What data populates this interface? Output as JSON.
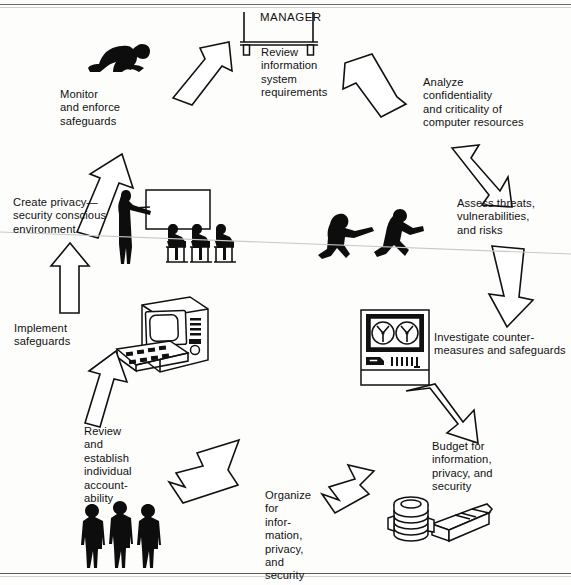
{
  "diagram": {
    "type": "circular-flow",
    "direction": "clockwise",
    "sign_label": "MANAGER",
    "stroke_color": "#111111",
    "fill_color": "#ffffff",
    "background_color": "#fdfdfc"
  },
  "steps": [
    {
      "id": "review",
      "label": "Review\ninformation\nsystem\nrequirements",
      "icon": "manager-desk-sign-icon",
      "position": "top"
    },
    {
      "id": "analyze",
      "label": "Analyze\nconfidentiality\nand criticality of\ncomputer resources",
      "icon": "none",
      "position": "upper-right"
    },
    {
      "id": "assess",
      "label": "Assess threats,\nvulnerabilities,\nand risks",
      "icon": "running-intruders-icon",
      "position": "right"
    },
    {
      "id": "investigate",
      "label": "Investigate counter-\nmeasures and safeguards",
      "icon": "tape-drive-icon",
      "position": "lower-right"
    },
    {
      "id": "budget",
      "label": "Budget for\ninformation,\nprivacy, and\nsecurity",
      "icon": "money-stack-icon",
      "position": "bottom-right"
    },
    {
      "id": "organize",
      "label": "Organize\nfor\ninfor-\nmation,\nprivacy,\nand\nsecurity",
      "icon": "none",
      "position": "bottom"
    },
    {
      "id": "accountability",
      "label": "Review\nand\nestablish\nindividual\naccount-\nability",
      "icon": "three-people-icon",
      "position": "bottom-left"
    },
    {
      "id": "implement",
      "label": "Implement\nsafeguards",
      "icon": "computer-terminal-icon",
      "position": "left"
    },
    {
      "id": "awareness",
      "label": "Create privacy—\nsecurity conscious\nenvironment",
      "icon": "classroom-presentation-icon",
      "position": "upper-left"
    },
    {
      "id": "monitor",
      "label": "Monitor\nand enforce\nsafeguards",
      "icon": "crawling-figure-icon",
      "position": "top-left"
    }
  ],
  "arrows": [
    {
      "id": "arrow-monitor-to-review",
      "from": "monitor",
      "to": "review",
      "direction": "up-right"
    },
    {
      "id": "arrow-review-to-analyze",
      "from": "review",
      "to": "analyze",
      "direction": "down-right"
    },
    {
      "id": "arrow-analyze-to-assess",
      "from": "analyze",
      "to": "assess",
      "direction": "down-right"
    },
    {
      "id": "arrow-assess-to-investigate",
      "from": "assess",
      "to": "investigate",
      "direction": "down"
    },
    {
      "id": "arrow-investigate-to-budget",
      "from": "investigate",
      "to": "budget",
      "direction": "down-left"
    },
    {
      "id": "arrow-budget-to-organize",
      "from": "budget",
      "to": "organize",
      "direction": "left"
    },
    {
      "id": "arrow-organize-to-accountability",
      "from": "organize",
      "to": "accountability",
      "direction": "left"
    },
    {
      "id": "arrow-accountability-to-implement",
      "from": "accountability",
      "to": "implement",
      "direction": "up"
    },
    {
      "id": "arrow-implement-to-awareness",
      "from": "implement",
      "to": "awareness",
      "direction": "up"
    },
    {
      "id": "arrow-awareness-to-monitor",
      "from": "awareness",
      "to": "monitor",
      "direction": "up-right"
    }
  ]
}
